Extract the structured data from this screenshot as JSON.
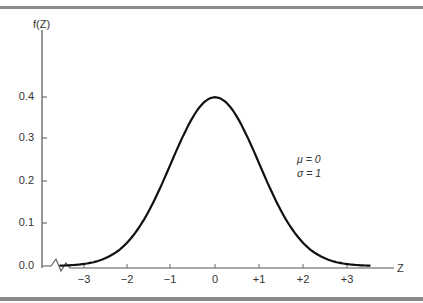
{
  "chart_data": {
    "type": "line",
    "title": "",
    "xlabel": "Z",
    "ylabel": "f(Z)",
    "x_ticks": [
      "-3",
      "-2",
      "-1",
      "0",
      "+1",
      "+2",
      "+3"
    ],
    "y_ticks": [
      "0.0",
      "0.1",
      "0.2",
      "0.3",
      "0.4"
    ],
    "xlim": [
      -3.5,
      3.5
    ],
    "ylim": [
      0.0,
      0.4
    ],
    "grid": false,
    "legend": null,
    "annotations": [
      "μ = 0",
      "σ = 1"
    ],
    "series": [
      {
        "name": "Standard normal density f(Z)",
        "x": [
          -3.5,
          -3,
          -2.5,
          -2,
          -1.5,
          -1,
          -0.5,
          0,
          0.5,
          1,
          1.5,
          2,
          2.5,
          3,
          3.5
        ],
        "values": [
          0.001,
          0.004,
          0.018,
          0.054,
          0.13,
          0.242,
          0.352,
          0.399,
          0.352,
          0.242,
          0.13,
          0.054,
          0.018,
          0.004,
          0.001
        ]
      }
    ],
    "axis_break": "zigzag break on x-axis between y-axis and Z = -3.5"
  },
  "labels": {
    "y_axis_title": "f(Z)",
    "x_axis_title": "Z",
    "y_ticks": [
      "0.4",
      "0.3",
      "0.2",
      "0.1",
      "0.0"
    ],
    "x_ticks": [
      "−3",
      "−2",
      "−1",
      "0",
      "+1",
      "+2",
      "+3"
    ],
    "mu": "μ = 0",
    "sigma": "σ = 1"
  }
}
